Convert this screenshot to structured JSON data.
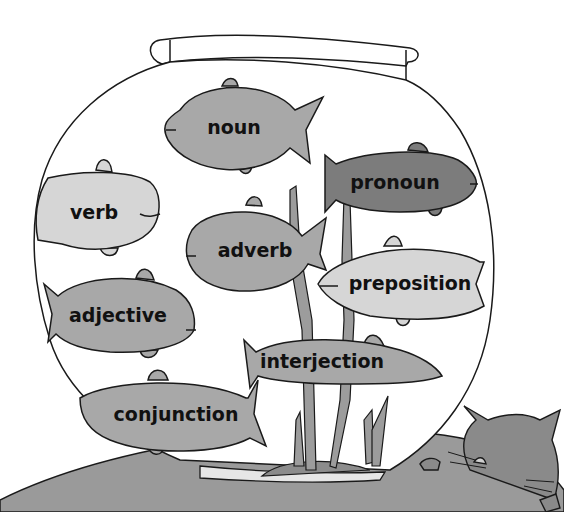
{
  "illustration": {
    "subject": "fishbowl of parts of speech",
    "colors": {
      "outline": "#1a1a1a",
      "table": "#9a9a9a",
      "fish_light": "#d6d6d6",
      "fish_mid": "#a8a8a8",
      "fish_dark": "#7c7c7c",
      "seaweed": "#9c9c9c",
      "cat": "#8a8a8a",
      "background": "#ffffff"
    },
    "fish": [
      {
        "id": "noun",
        "label": "noun",
        "x": 234,
        "y": 127,
        "font_size": 19,
        "facing": "left",
        "shade": "fish_mid"
      },
      {
        "id": "pronoun",
        "label": "pronoun",
        "x": 395,
        "y": 182,
        "font_size": 19,
        "facing": "right",
        "shade": "fish_dark"
      },
      {
        "id": "verb",
        "label": "verb",
        "x": 94,
        "y": 212,
        "font_size": 19,
        "facing": "right",
        "shade": "fish_light"
      },
      {
        "id": "adverb",
        "label": "adverb",
        "x": 255,
        "y": 250,
        "font_size": 19,
        "facing": "left",
        "shade": "fish_mid"
      },
      {
        "id": "preposition",
        "label": "preposition",
        "x": 410,
        "y": 283,
        "font_size": 19,
        "facing": "left",
        "shade": "fish_light"
      },
      {
        "id": "adjective",
        "label": "adjective",
        "x": 118,
        "y": 315,
        "font_size": 19,
        "facing": "right",
        "shade": "fish_mid"
      },
      {
        "id": "interjection",
        "label": "interjection",
        "x": 322,
        "y": 361,
        "font_size": 19,
        "facing": "right",
        "shade": "fish_mid"
      },
      {
        "id": "conjunction",
        "label": "conjunction",
        "x": 176,
        "y": 414,
        "font_size": 19,
        "facing": "left",
        "shade": "fish_mid"
      }
    ]
  }
}
